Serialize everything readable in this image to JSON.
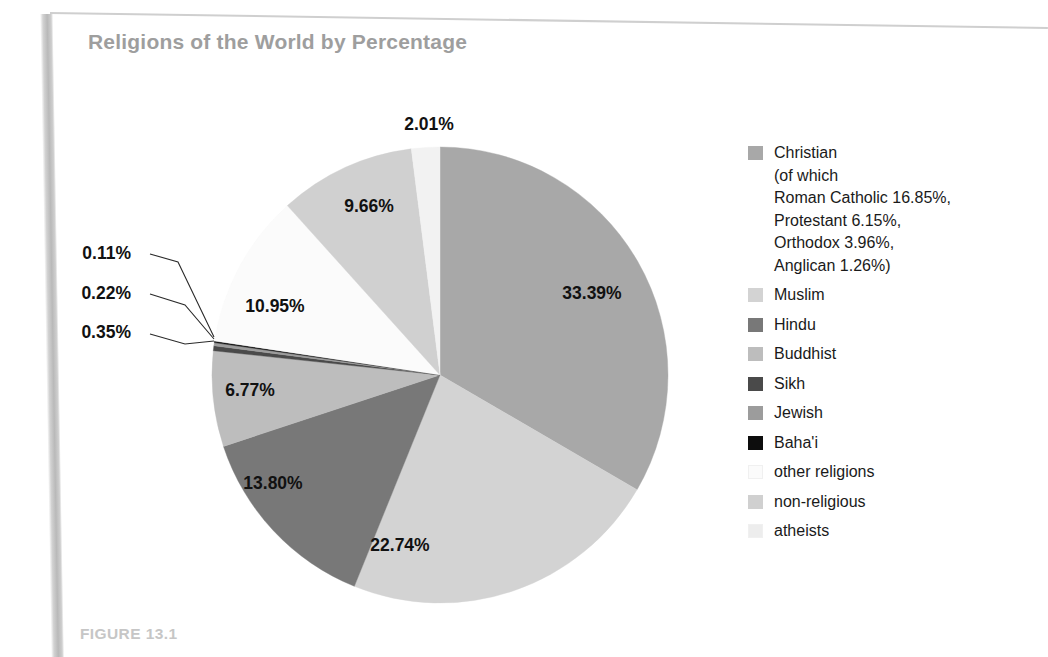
{
  "title": "Religions of the World by Percentage",
  "caption": "FIGURE 13.1",
  "chart_data": {
    "type": "pie",
    "title": "Religions of the World by Percentage",
    "xlabel": "",
    "ylabel": "",
    "units": "percent",
    "start_angle_deg": 0,
    "direction": "clockwise",
    "legend_position": "right",
    "grid": false,
    "categories": [
      "Christian",
      "Muslim",
      "Hindu",
      "Buddhist",
      "Sikh",
      "Jewish",
      "Baha'i",
      "other religions",
      "non-religious",
      "atheists"
    ],
    "values": [
      33.39,
      22.74,
      13.8,
      6.77,
      0.35,
      0.22,
      0.11,
      10.95,
      9.66,
      2.01
    ],
    "labels": [
      "33.39%",
      "22.74%",
      "13.80%",
      "6.77%",
      "0.35%",
      "0.22%",
      "0.11%",
      "10.95%",
      "9.66%",
      "2.01%"
    ],
    "colors": [
      "#a8a8a8",
      "#d3d3d3",
      "#787878",
      "#bdbdbd",
      "#4a4a4a",
      "#9c9c9c",
      "#0d0d0d",
      "#fbfbfb",
      "#d0d0d0",
      "#f2f2f2"
    ],
    "callout_slices": [
      "Baha'i",
      "Jewish",
      "Sikh"
    ],
    "subcategories": {
      "Christian": [
        {
          "name": "Roman Catholic",
          "value": 16.85,
          "label": "16.85%"
        },
        {
          "name": "Protestant",
          "value": 6.15,
          "label": "6.15%"
        },
        {
          "name": "Orthodox",
          "value": 3.96,
          "label": "3.96%"
        },
        {
          "name": "Anglican",
          "value": 1.26,
          "label": "1.26%"
        }
      ]
    }
  },
  "slice_labels": [
    {
      "text": "33.39%",
      "x": 592,
      "y": 299
    },
    {
      "text": "22.74%",
      "x": 400,
      "y": 551
    },
    {
      "text": "13.80%",
      "x": 273,
      "y": 489
    },
    {
      "text": "6.77%",
      "x": 250,
      "y": 396
    },
    {
      "text": "10.95%",
      "x": 275,
      "y": 312
    },
    {
      "text": "9.66%",
      "x": 369,
      "y": 212
    },
    {
      "text": "2.01%",
      "x": 429,
      "y": 130
    }
  ],
  "callouts": [
    {
      "text": "0.11%",
      "text_x": 131,
      "text_y": 259,
      "line": "M 150 254 L 178 262 L 214 337"
    },
    {
      "text": "0.22%",
      "text_x": 131,
      "text_y": 299,
      "line": "M 150 294 L 185 305 L 214 339"
    },
    {
      "text": "0.35%",
      "text_x": 131,
      "text_y": 338,
      "line": "M 150 334 L 185 344 L 214 341"
    }
  ],
  "legend": {
    "items": [
      {
        "label": "Christian\n(of which\nRoman Catholic 16.85%,\nProtestant 6.15%,\nOrthodox 3.96%,\nAnglican 1.26%)",
        "color": "#a8a8a8"
      },
      {
        "label": "Muslim",
        "color": "#d3d3d3"
      },
      {
        "label": "Hindu",
        "color": "#787878"
      },
      {
        "label": "Buddhist",
        "color": "#bdbdbd"
      },
      {
        "label": "Sikh",
        "color": "#4a4a4a"
      },
      {
        "label": "Jewish",
        "color": "#9c9c9c"
      },
      {
        "label": "Baha'i",
        "color": "#0d0d0d"
      },
      {
        "label": "other religions",
        "color": "#fbfbfb"
      },
      {
        "label": "non-religious",
        "color": "#d0d0d0"
      },
      {
        "label": "atheists",
        "color": "#ededed"
      }
    ]
  },
  "pie_geometry": {
    "cx": 440,
    "cy": 375,
    "r": 228
  }
}
